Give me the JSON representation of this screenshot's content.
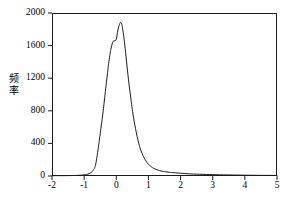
{
  "chart_data": {
    "type": "line",
    "title": "",
    "subtitle": "",
    "xlabel": "",
    "ylabel": "频率",
    "ylabel_chars": [
      "频",
      "率"
    ],
    "xlim": [
      -2,
      5
    ],
    "ylim": [
      0,
      2000
    ],
    "xticks": [
      -2,
      -1,
      0,
      1,
      2,
      3,
      4,
      5
    ],
    "xtick_labels": [
      "-2",
      "-1",
      "0",
      "1",
      "2",
      "3",
      "4",
      "5"
    ],
    "yticks": [
      0,
      400,
      800,
      1200,
      1600,
      2000
    ],
    "ytick_labels": [
      "0",
      "400",
      "800",
      "1200",
      "1600",
      "2000"
    ],
    "grid": false,
    "legend": null,
    "line_color": "#1a1a1a",
    "line_width": 1,
    "frame_color": "#1a1a1a",
    "background": "#ffffff",
    "series": [
      {
        "name": "频率分布",
        "x": [
          -2.0,
          -1.5,
          -1.2,
          -1.0,
          -0.9,
          -0.8,
          -0.72,
          -0.65,
          -0.58,
          -0.5,
          -0.42,
          -0.35,
          -0.28,
          -0.22,
          -0.16,
          -0.1,
          -0.05,
          0.0,
          0.05,
          0.1,
          0.15,
          0.2,
          0.26,
          0.32,
          0.38,
          0.45,
          0.52,
          0.6,
          0.7,
          0.8,
          0.9,
          1.0,
          1.1,
          1.2,
          1.35,
          1.5,
          1.65,
          1.8,
          2.0,
          2.3,
          2.7,
          3.1,
          3.5,
          4.0,
          4.5,
          5.0
        ],
        "y": [
          4,
          5,
          8,
          14,
          22,
          38,
          70,
          130,
          290,
          520,
          760,
          1000,
          1240,
          1430,
          1570,
          1650,
          1660,
          1680,
          1790,
          1860,
          1880,
          1800,
          1620,
          1400,
          1180,
          960,
          760,
          580,
          400,
          280,
          200,
          145,
          110,
          88,
          66,
          54,
          46,
          40,
          34,
          26,
          20,
          16,
          13,
          10,
          8,
          7
        ]
      }
    ]
  }
}
